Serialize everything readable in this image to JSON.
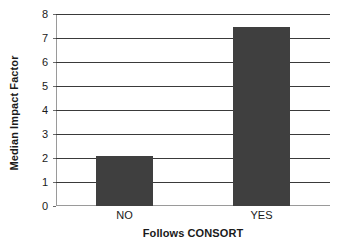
{
  "chart_data": {
    "type": "bar",
    "title": "",
    "subtitle": "",
    "categories": [
      "NO",
      "YES"
    ],
    "values": [
      2.1,
      7.45
    ],
    "series": [
      {
        "name": "Median Impact Factor",
        "values": [
          2.1,
          7.45
        ]
      }
    ],
    "xlabel": "Follows CONSORT",
    "ylabel": "Median Impact Factor",
    "ylim": [
      0,
      8
    ],
    "ytick_step": 1,
    "yticks": [
      0,
      1,
      2,
      3,
      4,
      5,
      6,
      7,
      8
    ],
    "ytick_labels": [
      "0",
      "1",
      "2",
      "3",
      "4",
      "5",
      "6",
      "7",
      "8"
    ],
    "grid": true,
    "grid_axis": "y",
    "legend": false,
    "legend_position": "none",
    "bar_color": "#3f3f3f",
    "grid_color": "#3a3a3a",
    "axis_color": "#9a9a9a",
    "background_color": "#ffffff",
    "annotations": []
  }
}
